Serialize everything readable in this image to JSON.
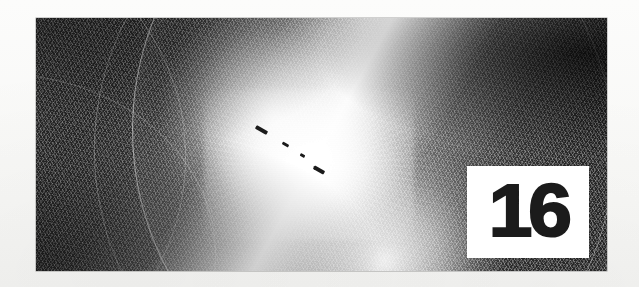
{
  "page": {
    "background_color": "#fbfbfa",
    "type": "book-chapter-opener-scan"
  },
  "artwork": {
    "name": "moire-spirograph-artwork",
    "description": "Dark full-bleed spirograph / guilloche line-mesh pattern with a bright diagonal bow-tie light flare through the centre",
    "background_color": "#262626",
    "line_color": "#ffffff",
    "frame": {
      "x": 36,
      "y": 18,
      "width": 571,
      "height": 253
    },
    "flare_angle_deg": 29,
    "axis_dashes": [
      {
        "x": 219,
        "y": 110,
        "width": 13,
        "height": 4
      },
      {
        "x": 246,
        "y": 125,
        "width": 7,
        "height": 3
      },
      {
        "x": 264,
        "y": 136,
        "width": 5,
        "height": 3
      },
      {
        "x": 277,
        "y": 150,
        "width": 12,
        "height": 4
      }
    ]
  },
  "badge": {
    "name": "chapter-number-badge",
    "number": "16",
    "background_color": "#ffffff",
    "text_color": "#1b1b1b",
    "frame": {
      "x": 467,
      "y": 166,
      "width": 122,
      "height": 92
    }
  }
}
